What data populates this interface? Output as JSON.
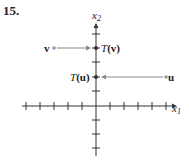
{
  "problem_number": "15.",
  "axes": {
    "x_label": "x",
    "x_sub": "1",
    "y_label": "x",
    "y_sub": "2",
    "x_ticks_left": 5,
    "x_ticks_right": 5,
    "y_ticks_up": 5,
    "y_ticks_down": 3
  },
  "points": {
    "v": {
      "label": "v",
      "coords": [
        -3,
        3
      ]
    },
    "T_v": {
      "label_T": "T",
      "label_arg": "(v)",
      "coords": [
        0,
        3
      ]
    },
    "u": {
      "label": "u",
      "coords": [
        5,
        2
      ]
    },
    "T_u": {
      "label_T": "T",
      "label_arg": "(u)",
      "coords": [
        0,
        2
      ]
    }
  },
  "colors": {
    "axis": "#333333",
    "arrow": "#888888",
    "text": "#222222"
  }
}
